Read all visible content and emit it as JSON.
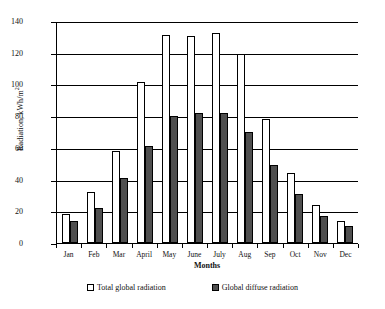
{
  "chart_data": {
    "type": "bar",
    "title": "",
    "xlabel": "Months",
    "ylabel": "Radiation, kWh/m2",
    "ylabel_prefix": "Radiation, kWh/m",
    "ylabel_superscript": "2",
    "ylim": [
      0,
      140
    ],
    "ytick_step": 20,
    "yticks": [
      0,
      20,
      40,
      60,
      80,
      100,
      120,
      140
    ],
    "ytick_labels": [
      "0",
      "20",
      "40",
      "60",
      "80",
      "100",
      "120",
      "140"
    ],
    "grid": true,
    "grid_axis": "y",
    "legend_position": "bottom",
    "categories": [
      "Jan",
      "Feb",
      "Mar",
      "April",
      "May",
      "June",
      "July",
      "Aug",
      "Sep",
      "Oct",
      "Nov",
      "Dec"
    ],
    "series": [
      {
        "name": "Total global radiation",
        "color": "#ffffff",
        "edge_color": "#000000",
        "values": [
          18.5,
          32,
          58,
          101.5,
          131,
          130.5,
          132.5,
          119,
          78,
          44,
          24,
          14
        ]
      },
      {
        "name": "Global diffuse radiation",
        "color": "#4f4f4f",
        "edge_color": "#000000",
        "values": [
          14,
          22,
          41,
          61,
          80,
          82,
          82,
          70,
          49,
          31,
          17,
          11
        ]
      }
    ]
  },
  "legend": {
    "items": [
      {
        "label": "Total global radiation",
        "swatch": "total"
      },
      {
        "label": "Global diffuse radiation",
        "swatch": "diffuse"
      }
    ]
  }
}
